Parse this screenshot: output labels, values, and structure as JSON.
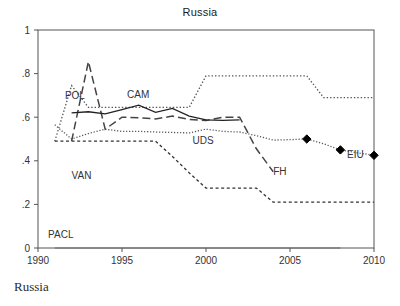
{
  "figure": {
    "title": "Russia",
    "caption": "Russia"
  },
  "chart_data": {
    "type": "line",
    "title": "Russia",
    "xlabel": "",
    "ylabel": "",
    "xlim": [
      1990,
      2010
    ],
    "ylim": [
      0,
      1
    ],
    "grid": false,
    "legend": "inline-annotations",
    "xticks": [
      1990,
      1995,
      2000,
      2005,
      2010
    ],
    "xticklabels": [
      "1990",
      "1995",
      "2000",
      "2005",
      "2010"
    ],
    "yticks": [
      0,
      0.2,
      0.4,
      0.6,
      0.8,
      1
    ],
    "yticklabels": [
      "0",
      ".2",
      ".4",
      ".6",
      ".8",
      "1"
    ],
    "series": [
      {
        "name": "POL",
        "label": "POL",
        "style": "dotted",
        "color": "#555555",
        "label_x": 1991.6,
        "label_y": 0.685,
        "x": [
          1991,
          1992,
          1993,
          1994,
          1995,
          1996,
          1997,
          1998,
          1999,
          2000,
          2001,
          2002,
          2003,
          2004,
          2005,
          2006,
          2007,
          2008,
          2009,
          2010
        ],
        "y": [
          0.49,
          0.745,
          0.645,
          0.645,
          0.645,
          0.645,
          0.645,
          0.645,
          0.645,
          0.79,
          0.79,
          0.79,
          0.79,
          0.79,
          0.79,
          0.79,
          0.69,
          0.69,
          0.69,
          0.69
        ]
      },
      {
        "name": "VAN",
        "label": "VAN",
        "style": "long-dash",
        "color": "#444444",
        "label_x": 1992.0,
        "label_y": 0.315,
        "x": [
          1992,
          1993,
          1994,
          1995,
          1996,
          1997,
          1998,
          1999,
          2000,
          2001,
          2002,
          2003,
          2004
        ],
        "y": [
          0.49,
          0.855,
          0.545,
          0.6,
          0.598,
          0.592,
          0.605,
          0.59,
          0.585,
          0.6,
          0.6,
          0.455,
          0.35
        ]
      },
      {
        "name": "CAM",
        "label": "CAM",
        "style": "solid",
        "color": "#222222",
        "label_x": 1995.3,
        "label_y": 0.69,
        "x": [
          1992,
          1993,
          1994,
          1995,
          1996,
          1997,
          1998,
          1999,
          2000,
          2001,
          2002
        ],
        "y": [
          0.62,
          0.625,
          0.615,
          0.635,
          0.655,
          0.622,
          0.64,
          0.605,
          0.588,
          0.585,
          0.588
        ]
      },
      {
        "name": "UDS",
        "label": "UDS",
        "style": "fine-dotted",
        "color": "#555555",
        "label_x": 1999.2,
        "label_y": 0.475,
        "x": [
          1991,
          1992,
          1993,
          1994,
          1995,
          1996,
          1997,
          1998,
          1999,
          2000,
          2001,
          2002,
          2003,
          2004,
          2005,
          2006,
          2007,
          2008,
          2009,
          2010
        ],
        "y": [
          0.565,
          0.5,
          0.525,
          0.545,
          0.535,
          0.535,
          0.532,
          0.53,
          0.528,
          0.545,
          0.535,
          0.532,
          0.515,
          0.495,
          0.497,
          0.5,
          0.478,
          0.45,
          0.437,
          0.425
        ]
      },
      {
        "name": "FH",
        "label": "FH",
        "style": "short-dash",
        "color": "#333333",
        "label_x": 2004.0,
        "label_y": 0.335,
        "x": [
          1991,
          1992,
          1993,
          1994,
          1995,
          1996,
          1997,
          1998,
          1999,
          2000,
          2001,
          2002,
          2003,
          2004,
          2005,
          2006,
          2007,
          2008,
          2009,
          2010
        ],
        "y": [
          0.49,
          0.49,
          0.49,
          0.49,
          0.49,
          0.49,
          0.49,
          0.42,
          0.345,
          0.275,
          0.275,
          0.275,
          0.275,
          0.21,
          0.21,
          0.21,
          0.21,
          0.21,
          0.21,
          0.21
        ]
      },
      {
        "name": "PACL",
        "label": "PACL",
        "style": "solid-thin",
        "color": "#666666",
        "label_x": 1990.6,
        "label_y": 0.045,
        "x": [
          1991,
          1995,
          2000,
          2005,
          2008
        ],
        "y": [
          0.0,
          0.0,
          0.0,
          0.0,
          0.0
        ]
      },
      {
        "name": "EIU",
        "label": "EIU",
        "style": "markers",
        "marker": "diamond",
        "color": "#000000",
        "label_x": 2008.4,
        "label_y": 0.415,
        "x": [
          2006,
          2008,
          2010
        ],
        "y": [
          0.5,
          0.45,
          0.425
        ]
      }
    ]
  }
}
